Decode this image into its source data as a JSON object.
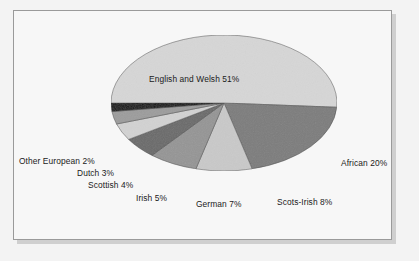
{
  "chart_data": {
    "type": "pie",
    "title": "",
    "subtitle": "",
    "xlabel": "",
    "ylabel": "",
    "legend_position": "none",
    "grid": false,
    "three_d": true,
    "label_format": "{name} {value}%",
    "categories": [
      "English and Welsh",
      "African",
      "Scots-Irish",
      "German",
      "Irish",
      "Scottish",
      "Dutch",
      "Other European"
    ],
    "values": [
      51,
      20,
      8,
      7,
      5,
      4,
      3,
      2
    ],
    "slices": [
      {
        "name": "English and Welsh",
        "value": 51,
        "label": "English and Welsh 51%",
        "color": "#d6d6d6",
        "side_color": "#b5b5b5"
      },
      {
        "name": "African",
        "value": 20,
        "label": "African 20%",
        "color": "#7c7c7c",
        "side_color": "#5e5e5e"
      },
      {
        "name": "Scots-Irish",
        "value": 8,
        "label": "Scots-Irish 8%",
        "color": "#c9c9c9",
        "side_color": "#a8a8a8"
      },
      {
        "name": "German",
        "value": 7,
        "label": "German 7%",
        "color": "#959595",
        "side_color": "#777777"
      },
      {
        "name": "Irish",
        "value": 5,
        "label": "Irish 5%",
        "color": "#6a6a6a",
        "side_color": "#4f4f4f"
      },
      {
        "name": "Scottish",
        "value": 4,
        "label": "Scottish 4%",
        "color": "#d2d2d2",
        "side_color": "#b0b0b0"
      },
      {
        "name": "Dutch",
        "value": 3,
        "label": "Dutch 3%",
        "color": "#9c9c9c",
        "side_color": "#7e7e7e"
      },
      {
        "name": "Other European",
        "value": 2,
        "label": "Other European 2%",
        "color": "#111111",
        "side_color": "#0a0a0a"
      }
    ],
    "total": 100
  },
  "labels": {
    "english_and_welsh": "English and Welsh 51%",
    "african": "African 20%",
    "scots_irish": "Scots-Irish 8%",
    "german": "German 7%",
    "irish": "Irish 5%",
    "scottish": "Scottish 4%",
    "dutch": "Dutch 3%",
    "other_european": "Other European 2%"
  },
  "colors": {
    "page_background": "#f3f3f3",
    "panel_background": "#f7f7f7",
    "frame_border": "#9a9a9a",
    "frame_shadow": "#cfcfcf",
    "label_text": "#1a1a1a"
  }
}
